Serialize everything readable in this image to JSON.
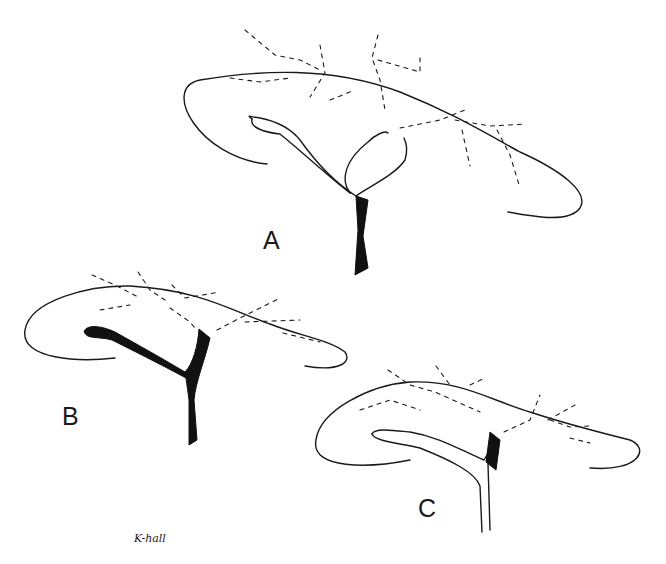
{
  "figure": {
    "panels": [
      {
        "id": "A",
        "label": "A",
        "description": "Pancreas outline with branching duct (type A), dashed vessels along upper border"
      },
      {
        "id": "B",
        "label": "B",
        "description": "Pancreas outline with solid black Y-shaped duct (type B), dashed vessels"
      },
      {
        "id": "C",
        "label": "C",
        "description": "Pancreas outline with double-contoured duct and short solid segment (type C), dashed vessels"
      }
    ],
    "signature": "K-hall",
    "colors": {
      "line": "#1a1a1a",
      "background": "#ffffff"
    }
  }
}
